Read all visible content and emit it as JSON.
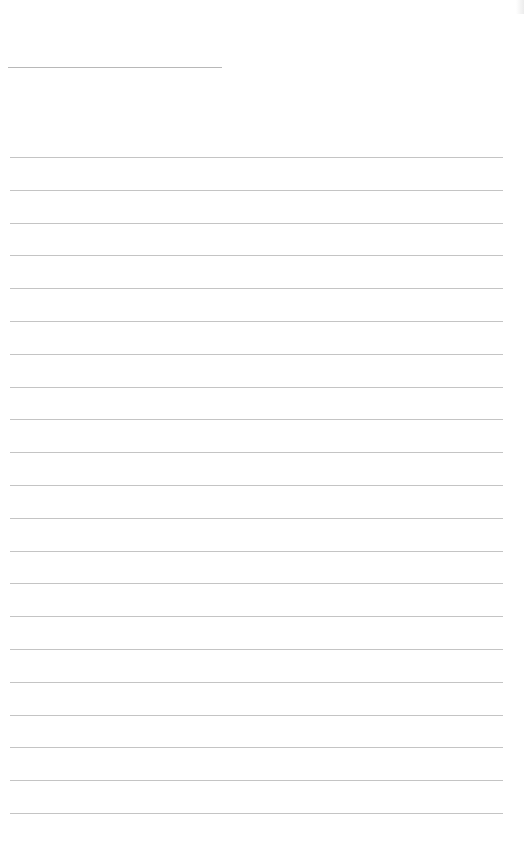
{
  "document": {
    "type": "lined-paper",
    "title_line": {
      "text": "",
      "line_color": "#b8b8b8"
    },
    "writing_lines": {
      "count": 21,
      "spacing_px": 32.8,
      "line_color": "#c4c4c4",
      "values": [
        "",
        "",
        "",
        "",
        "",
        "",
        "",
        "",
        "",
        "",
        "",
        "",
        "",
        "",
        "",
        "",
        "",
        "",
        "",
        "",
        ""
      ]
    },
    "background_color": "#ffffff"
  }
}
